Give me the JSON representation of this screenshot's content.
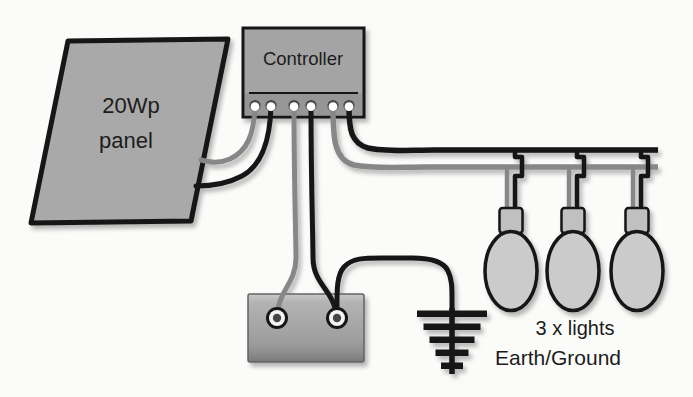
{
  "figure": {
    "background": "#fbfbfa",
    "panel": {
      "label_line1": "20Wp",
      "label_line2": "panel"
    },
    "controller": {
      "label": "Controller",
      "terminal_count": 6
    },
    "battery": {
      "terminal_count": 2
    },
    "lights": {
      "caption": "3 x lights",
      "count": 3
    },
    "earth": {
      "caption": "Earth/Ground"
    },
    "colors": {
      "panel_fill": "#a9a9a9",
      "controller_fill": "#a4a4a4",
      "controller_strip_fill": "#969696",
      "bulb_fill": "#cbcbcb",
      "socket_fill": "#c0c0c0",
      "wire_black": "#161616",
      "wire_gray": "#878787",
      "text_color": "#1c1c1c"
    }
  }
}
